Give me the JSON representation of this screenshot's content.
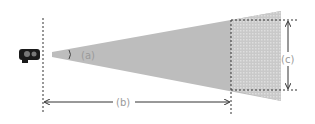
{
  "diagram": {
    "labels": {
      "angle": "(a)",
      "distance": "(b)",
      "height": "(c)"
    },
    "colors": {
      "cone": "#bdbdbd",
      "cone_far": "#cfcfcf",
      "lines": "#333333",
      "label": "#9a9a9a",
      "camera": "#1a1a1a"
    },
    "icons": {
      "source": "camera-icon"
    }
  }
}
